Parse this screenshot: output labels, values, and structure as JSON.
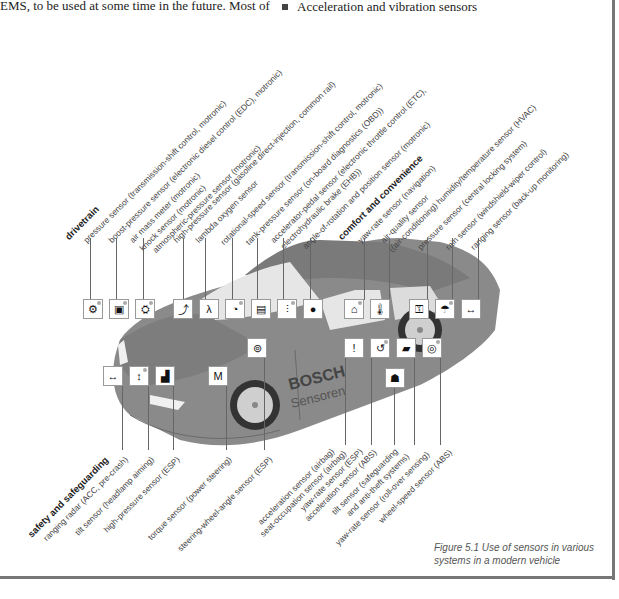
{
  "page": {
    "top_text": "EMS, to be used at some time in the future. Most of",
    "bullet_item": "Acceleration and vibration sensors"
  },
  "figure": {
    "caption_line1": "Figure 5.1  Use of sensors in various",
    "caption_line2": "systems in a modern vehicle",
    "car_branding": {
      "line1": "BOSCH",
      "line2": "Sensoren"
    },
    "groups": {
      "drivetrain": {
        "heading": "drivetrain",
        "labels": [
          "pressure sensor (transmission-shift control, motronic)",
          "boost-pressure sensor (electronic diesel control (EDC), motronic)",
          "air mass meter (motronic)",
          "knock sensor (motronic)",
          "atmospheric-pressure sensor (motronic)",
          "high-pressure sensor (gasoline direct-injection, common rail)",
          "lambda oxygen sensor",
          "rotational-speed sensor (transmission-shift control, motronic)",
          "tank-pressure sensor (on-board diagnostics (OBD))",
          "accelerator-pedal sensor (electronic throttle control (ETC),",
          "electrohydraulic brake (EHB))",
          "angle-of-rotation and position sensor (motronic)"
        ]
      },
      "comfort": {
        "heading": "comfort and convenience",
        "labels": [
          "yaw-rate sensor (navigation)",
          "air-quality sensor",
          "((air-conditioning) humidity/temperature sensor (HVAC)",
          "pressure sensor (central locking system)",
          "rain sensor (windshield-wiper control)",
          "ranging sensor (back-up monitoring)"
        ]
      },
      "safety": {
        "heading": "safety and safeguarding",
        "labels": [
          "ranging radar (ACC, pre-crash)",
          "tilt sensor (headlamp aiming)",
          "high-pressure sensor (ESP)",
          "torque sensor (power steering)",
          "steering-wheel-angle sensor (ESP)",
          "acceleration sensor (airbag)",
          "seat-occupation sensor (airbag)",
          "yaw-rate sensor (ESP)",
          "acceleration sensor (ABS)",
          "tilt sensor (safeguarding",
          "and anti-theft systems)",
          "yaw-rate sensor (roll-over sensing)",
          "wheel-speed sensor (ABS)"
        ]
      }
    },
    "icons": {
      "top_row": [
        "gear",
        "turbo",
        "engine",
        "injector",
        "lambda-car",
        "speed-gauge",
        "tank",
        "pedals",
        "brake",
        "gps",
        "ac-temp",
        "lock-car",
        "wiper",
        "ranging"
      ],
      "mid": [
        "steering-wheel"
      ],
      "left_row": [
        "radar",
        "tilt",
        "pressure",
        "torque"
      ],
      "right_row": [
        "airbag",
        "yaw",
        "acceleration",
        "wheel-speed"
      ],
      "lower": [
        "antitheft"
      ]
    },
    "colors": {
      "car_body": "#8a8a8a",
      "glass": "#e6e6e6",
      "frame": "#777777",
      "text": "#444444"
    }
  }
}
